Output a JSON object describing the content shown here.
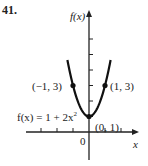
{
  "problem_number": "41.",
  "chart_data": {
    "type": "line",
    "title": "",
    "function_label": "f(x) = 1 + 2x²",
    "function_label_parts": {
      "lhs": "f(x) = 1 + 2x",
      "exp": "2"
    },
    "xlabel": "x",
    "ylabel": "f(x)",
    "origin_label": "0",
    "xlim": [
      -1.5,
      1.5
    ],
    "ylim": [
      -1.5,
      5.5
    ],
    "x_ticks": [
      -3,
      -2,
      -1,
      1,
      2
    ],
    "y_ticks": [
      1,
      2,
      3,
      4,
      5,
      6
    ],
    "grid": false,
    "series": [
      {
        "name": "f(x) = 1 + 2x^2",
        "equation": {
          "a": 2,
          "c": 1
        },
        "x_range": [
          -1.35,
          1.35
        ]
      }
    ],
    "points": [
      {
        "x": -1,
        "y": 3,
        "label": "(−1, 3)"
      },
      {
        "x": 1,
        "y": 3,
        "label": "(1, 3)"
      },
      {
        "x": 0,
        "y": 1,
        "label": "(0, 1)"
      }
    ]
  }
}
